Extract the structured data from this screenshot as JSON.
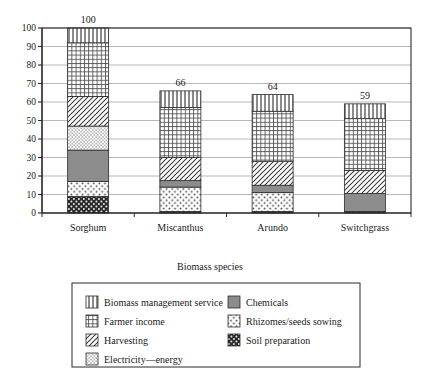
{
  "chart_data": {
    "type": "bar",
    "stacked": true,
    "title": "",
    "xlabel": "Biomass species",
    "ylabel": "",
    "ylim": [
      0,
      100
    ],
    "ytick_step": 10,
    "yticks": [
      0,
      10,
      20,
      30,
      40,
      50,
      60,
      70,
      80,
      90,
      100
    ],
    "grid": true,
    "grid_axis": "y",
    "legend_position": "below-plot",
    "categories": [
      "Sorghum",
      "Miscanthus",
      "Arundo",
      "Switchgrass"
    ],
    "totals": [
      100,
      66,
      64,
      59
    ],
    "total_labels": [
      "100",
      "66",
      "64",
      "59"
    ],
    "series": [
      {
        "name": "Soil preparation",
        "pattern": "dark-checker",
        "values": [
          9,
          0.8,
          0.8,
          0.8
        ]
      },
      {
        "name": "Rhizomes/seeds sowing",
        "pattern": "sparse-dots",
        "values": [
          8,
          13.2,
          10.2,
          0
        ]
      },
      {
        "name": "Chemicals",
        "pattern": "solid-gray",
        "values": [
          17,
          3.5,
          4,
          9.7
        ]
      },
      {
        "name": "Electricity—energy",
        "pattern": "fine-dots",
        "values": [
          13,
          0,
          0,
          0
        ]
      },
      {
        "name": "Harvesting",
        "pattern": "diagonal-hatch",
        "values": [
          16,
          12.5,
          13,
          12.5
        ]
      },
      {
        "name": "Farmer income",
        "pattern": "grid-cross",
        "values": [
          29,
          27,
          27,
          28
        ]
      },
      {
        "name": "Biomass management service",
        "pattern": "vertical-lines",
        "values": [
          8,
          9,
          9,
          8
        ]
      }
    ]
  },
  "legend": {
    "column_left": [
      {
        "label": "Biomass management service",
        "pattern": "vertical-lines"
      },
      {
        "label": "Farmer income",
        "pattern": "grid-cross"
      },
      {
        "label": "Harvesting",
        "pattern": "diagonal-hatch"
      },
      {
        "label": "Electricity—energy",
        "pattern": "fine-dots"
      }
    ],
    "column_right": [
      {
        "label": "Chemicals",
        "pattern": "solid-gray"
      },
      {
        "label": "Rhizomes/seeds sowing",
        "pattern": "sparse-dots"
      },
      {
        "label": "Soil preparation",
        "pattern": "dark-checker"
      }
    ]
  },
  "colors": {
    "axis": "#2b2b2b",
    "grid": "#9a9a9a",
    "bar_outline": "#2b2b2b",
    "chemicals_fill": "#8c8c8c",
    "soil_fill": "#2a2a2a",
    "background": "#ffffff"
  }
}
